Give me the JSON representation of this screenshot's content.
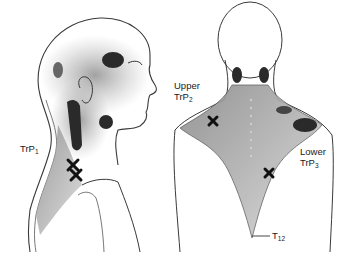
{
  "figure": {
    "views": [
      "lateral-head-neck",
      "posterior-back"
    ]
  },
  "labels": {
    "trp1": {
      "main": "TrP",
      "sub": "1"
    },
    "upper_trp2": {
      "line1": "Upper",
      "main": "TrP",
      "sub": "2"
    },
    "lower_trp3": {
      "line1": "Lower",
      "main": "TrP",
      "sub": "3"
    },
    "t12": {
      "main": "T",
      "sub": "12"
    }
  },
  "colors": {
    "line": "#3a3a3a",
    "pain_zone": "#2a2a2a",
    "marker": "#111111",
    "muscle_fill": "#bdbdbd"
  }
}
